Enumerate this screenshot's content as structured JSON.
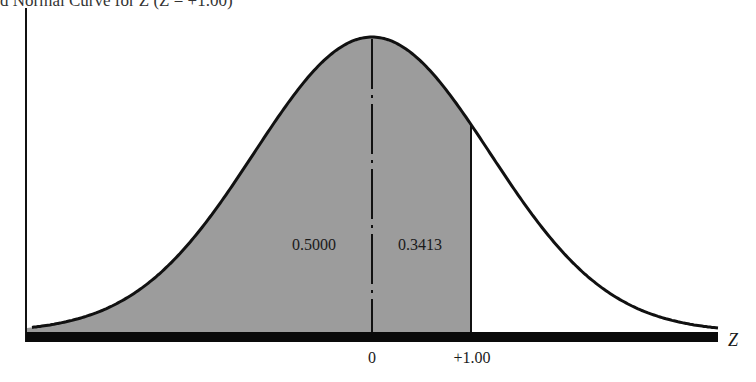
{
  "chart_data": {
    "type": "area",
    "title_visible_fragment": "d Normal Curve for Z (Z = +1.00)",
    "xlabel": "Z",
    "ylabel": "",
    "distribution": "standard normal",
    "mean": 0,
    "sd": 1,
    "x_range": [
      -3.5,
      3.5
    ],
    "ticks": [
      {
        "z": 0,
        "label": "0"
      },
      {
        "z": 1.0,
        "label": "+1.00"
      }
    ],
    "shaded_regions": [
      {
        "from": "-inf",
        "to": 0,
        "area": 0.5,
        "label": "0.5000"
      },
      {
        "from": 0,
        "to": 1.0,
        "area": 0.3413,
        "label": "0.3413"
      }
    ],
    "total_shaded_area": 0.8413,
    "mean_line": {
      "z": 0,
      "style": "dash-dot"
    },
    "boundary_line": {
      "z": 1.0,
      "style": "solid"
    },
    "grid": false,
    "legend": null
  },
  "colors": {
    "shade": "#9c9c9c",
    "curve": "#111111",
    "axis": "#111111",
    "background": "#ffffff"
  },
  "labels": {
    "title": "d Normal Curve for Z (Z = +1.00)",
    "left_area": "0.5000",
    "right_area": "0.3413",
    "tick_zero": "0",
    "tick_one": "+1.00",
    "axis_z": "Z"
  }
}
